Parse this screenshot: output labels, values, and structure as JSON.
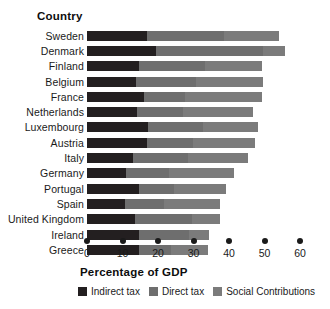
{
  "chart_data": {
    "type": "bar",
    "orientation": "horizontal",
    "stacked": true,
    "title": "",
    "ylabel": "Country",
    "xlabel": "Percentage of GDP",
    "xlim": [
      0,
      60
    ],
    "xticks": [
      0,
      10,
      20,
      30,
      40,
      50,
      60
    ],
    "xtick_labels": [
      "0",
      "10",
      "20",
      "30",
      "40",
      "50",
      "60"
    ],
    "grid": false,
    "legend_position": "bottom",
    "categories": [
      "Sweden",
      "Denmark",
      "Finland",
      "Belgium",
      "France",
      "Netherlands",
      "Luxembourg",
      "Austria",
      "Italy",
      "Germany",
      "Portugal",
      "Spain",
      "United Kingdom",
      "Ireland",
      "Greece"
    ],
    "series": [
      {
        "name": "Indirect tax",
        "color": "#231f20",
        "values": [
          17.0,
          19.5,
          14.6,
          13.8,
          16.0,
          14.1,
          17.2,
          16.9,
          13.0,
          11.0,
          14.6,
          10.7,
          13.5,
          14.6,
          14.6
        ]
      },
      {
        "name": "Direct tax",
        "color": "#6e6e6e",
        "values": [
          21.5,
          30.0,
          18.5,
          17.0,
          11.5,
          13.0,
          15.5,
          13.0,
          15.5,
          12.0,
          10.0,
          11.0,
          16.0,
          14.0,
          9.0
        ]
      },
      {
        "name": "Social Contributions",
        "color": "#7b7b7b",
        "values": [
          15.5,
          6.3,
          16.2,
          18.8,
          21.8,
          19.7,
          15.5,
          17.4,
          16.9,
          18.5,
          14.6,
          15.8,
          8.0,
          5.8,
          10.5
        ]
      }
    ],
    "totals": [
      54.0,
      55.8,
      49.3,
      49.6,
      49.3,
      46.8,
      48.2,
      47.3,
      45.4,
      43.4,
      39.2,
      37.5,
      37.5,
      34.4,
      34.1
    ]
  },
  "legend": {
    "items": [
      {
        "label": "Indirect tax",
        "color": "#231f20"
      },
      {
        "label": "Direct tax",
        "color": "#6e6e6e"
      },
      {
        "label": "Social Contributions",
        "color": "#7b7b7b"
      }
    ]
  }
}
